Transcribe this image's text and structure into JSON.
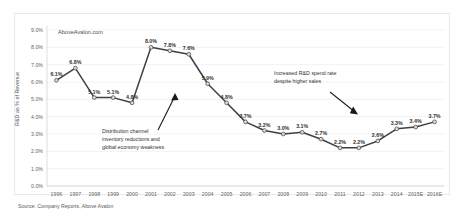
{
  "watermark": "AboveAvalon.com",
  "source_note": "Source: Company Reports, Above Avalon",
  "annotations": {
    "left": {
      "line1": "Distribution channel",
      "line2": "inventory reductions and",
      "line3": "global economy weakness",
      "target_year": "2001"
    },
    "right": {
      "line1": "Increased R&D spend rate",
      "line2": "despite higher sales",
      "target_year": "2013"
    }
  },
  "chart_data": {
    "type": "line",
    "title": "",
    "xlabel": "",
    "ylabel": "R&D as % of Revenue",
    "ylim": [
      0,
      9
    ],
    "ytick_labels": [
      "0.0%",
      "1.0%",
      "2.0%",
      "3.0%",
      "4.0%",
      "5.0%",
      "6.0%",
      "7.0%",
      "8.0%",
      "9.0%"
    ],
    "ytick_values": [
      0,
      1,
      2,
      3,
      4,
      5,
      6,
      7,
      8,
      9
    ],
    "grid": true,
    "legend": "none",
    "categories": [
      "1996",
      "1997",
      "1998",
      "1999",
      "2000",
      "2001",
      "2002",
      "2003",
      "2004",
      "2005",
      "2006",
      "2007",
      "2008",
      "2009",
      "2010",
      "2011",
      "2012",
      "2013",
      "2014",
      "2015E",
      "2016E"
    ],
    "values": [
      6.1,
      6.8,
      5.1,
      5.1,
      4.8,
      8.0,
      7.8,
      7.6,
      5.9,
      4.8,
      3.7,
      3.2,
      3.0,
      3.1,
      2.7,
      2.2,
      2.2,
      2.6,
      3.3,
      3.4,
      3.7
    ],
    "data_labels": [
      "6.1%",
      "6.8%",
      "5.1%",
      "5.1%",
      "4.8%",
      "8.0%",
      "7.8%",
      "7.6%",
      "5.9%",
      "4.8%",
      "3.7%",
      "3.2%",
      "3.0%",
      "3.1%",
      "2.7%",
      "2.2%",
      "2.2%",
      "2.6%",
      "3.3%",
      "3.4%",
      "3.7%"
    ],
    "series_color": "#404040",
    "marker_color": "#d9d9d9"
  }
}
